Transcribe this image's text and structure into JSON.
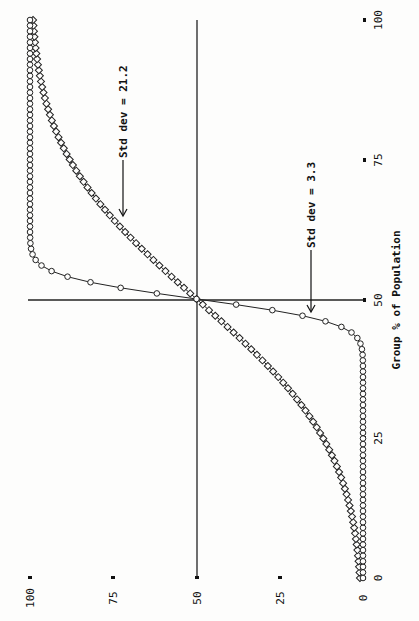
{
  "chart_data": {
    "type": "line",
    "title": "",
    "xlabel": "Group % of Population",
    "ylabel": "",
    "orientation": "rotated 90 degrees counter-clockwise on page",
    "xlim": [
      0,
      100
    ],
    "ylim": [
      0,
      100
    ],
    "x_ticks": [
      "0",
      "25",
      "50",
      "75",
      "100"
    ],
    "y_ticks": [
      "0",
      "25",
      "50",
      "75",
      "100"
    ],
    "grid": false,
    "crosshair_at": [
      50,
      50
    ],
    "series": [
      {
        "name": "Std dev = 21.2",
        "marker": "square",
        "std_dev": 21.2,
        "mean": 50,
        "x_step": 1,
        "shape": "normal CDF"
      },
      {
        "name": "Std dev = 3.3",
        "marker": "diamond",
        "std_dev": 3.3,
        "mean": 50,
        "x_step": 1,
        "shape": "normal CDF"
      }
    ],
    "annotations": [
      {
        "text": "Std dev = 21.2",
        "points_to": "shallow curve",
        "approx_x": 62
      },
      {
        "text": "Std dev = 3.3",
        "points_to": "steep curve",
        "approx_x": 47
      }
    ],
    "sample_values": {
      "x": [
        0,
        10,
        20,
        30,
        40,
        45,
        48,
        50,
        52,
        55,
        60,
        70,
        80,
        90,
        100
      ],
      "std_21_2": [
        0.9,
        2.9,
        7.8,
        17.2,
        31.8,
        40.7,
        46.2,
        50,
        53.8,
        59.3,
        68.2,
        82.8,
        92.2,
        97.1,
        99.1
      ],
      "std_3_3": [
        0,
        0,
        0,
        0,
        0.1,
        6.5,
        27.1,
        50,
        72.9,
        93.5,
        99.9,
        100,
        100,
        100,
        100
      ]
    }
  },
  "labels": {
    "xlabel": "Group % of Population",
    "ann1": "Std dev = 21.2",
    "ann2": "Std dev = 3.3",
    "xt0": "0",
    "xt25": "25",
    "xt50": "50",
    "xt75": "75",
    "xt100": "100",
    "yt0": "0",
    "yt25": "25",
    "yt50": "50",
    "yt75": "75",
    "yt100": "100"
  }
}
